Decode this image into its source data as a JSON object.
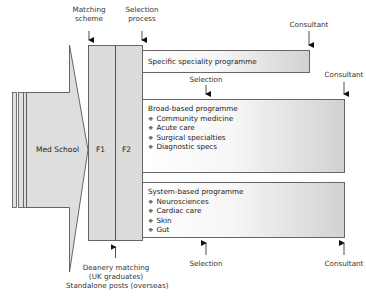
{
  "diagram": {
    "type": "flow",
    "stages": {
      "med_school": "Med School",
      "f1": "F1",
      "f2": "F2"
    },
    "top_labels": {
      "matching_scheme": "Matching\nscheme",
      "matching_line1": "Matching",
      "matching_line2": "scheme",
      "selection_line1": "Selection",
      "selection_line2": "process"
    },
    "bottom_labels": {
      "line1": "Deanery matching",
      "line2": "(UK graduates)",
      "line3": "Standalone posts (overseas)"
    },
    "programmes": [
      {
        "title": "Specific speciality programme",
        "items": [],
        "end_label": "Consultant"
      },
      {
        "title": "Broad-based programme",
        "items": [
          "Community medicine",
          "Acute care",
          "Surgical specialties",
          "Diagnostic specs"
        ],
        "selection_label": "Selection",
        "end_label": "Consultant"
      },
      {
        "title": "System-based programme",
        "items": [
          "Neurosciences",
          "Cardiac care",
          "Skin",
          "Gut"
        ],
        "selection_label": "Selection",
        "end_label": "Consultant"
      }
    ],
    "bullet_glyph": "❖",
    "colors": {
      "block_fill": "#dcdcdc",
      "stroke": "#555555",
      "gradient_light": "#ffffff",
      "gradient_dark": "#d2d2d2"
    }
  }
}
